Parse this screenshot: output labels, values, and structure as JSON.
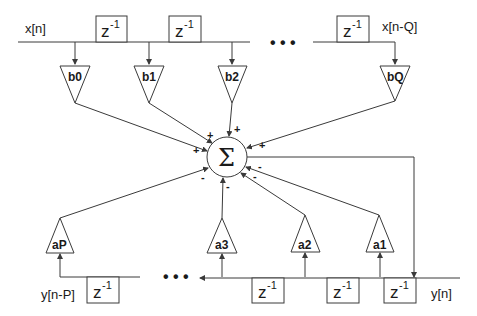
{
  "diagram": {
    "input_label": "x[n]",
    "input_delayed_label": "x[n-Q]",
    "output_label": "y[n]",
    "output_delayed_label": "y[n-P]",
    "delay": {
      "base": "z",
      "exponent": "-1"
    },
    "ellipsis": "• • •",
    "sum_symbol": "Σ",
    "feedforward_gains": [
      "b0",
      "b1",
      "b2",
      "bQ"
    ],
    "feedback_gains": [
      "aP",
      "a3",
      "a2",
      "a1"
    ],
    "feedforward_sign": "+",
    "feedback_sign": "-"
  }
}
